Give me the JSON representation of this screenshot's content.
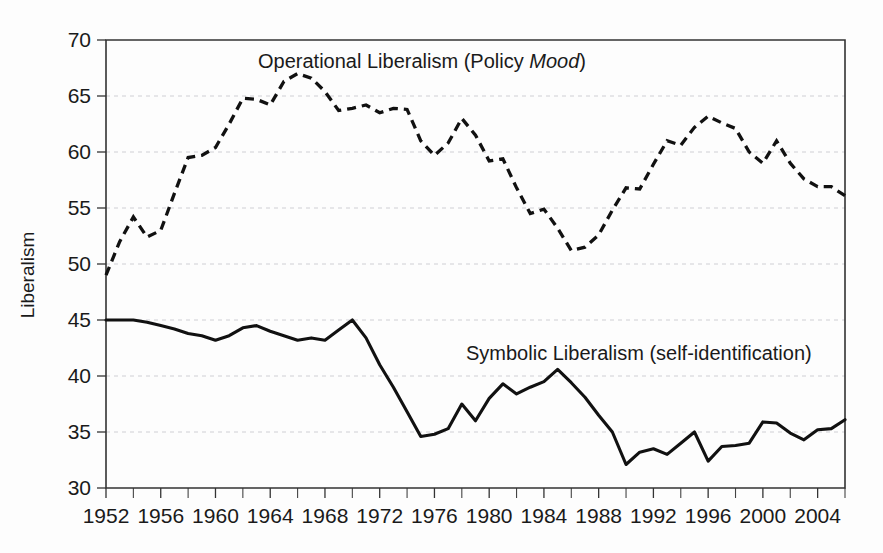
{
  "chart_data": {
    "type": "line",
    "title": "",
    "xlabel": "",
    "ylabel": "Liberalism",
    "xlim": [
      1952,
      2006
    ],
    "ylim": [
      30,
      70
    ],
    "ytick_step": 5,
    "xtick_label_step": 4,
    "xtick_minor_step": 2,
    "grid": true,
    "legend_position": "inline-annotations",
    "yticks": [
      30,
      35,
      40,
      45,
      50,
      55,
      60,
      65,
      70
    ],
    "xticks": [
      1952,
      1956,
      1960,
      1964,
      1968,
      1972,
      1976,
      1980,
      1984,
      1988,
      1992,
      1996,
      2000,
      2004
    ],
    "x": [
      1952,
      1953,
      1954,
      1955,
      1956,
      1957,
      1958,
      1959,
      1960,
      1961,
      1962,
      1963,
      1964,
      1965,
      1966,
      1967,
      1968,
      1969,
      1970,
      1971,
      1972,
      1973,
      1974,
      1975,
      1976,
      1977,
      1978,
      1979,
      1980,
      1981,
      1982,
      1983,
      1984,
      1985,
      1986,
      1987,
      1988,
      1989,
      1990,
      1991,
      1992,
      1993,
      1994,
      1995,
      1996,
      1997,
      1998,
      1999,
      2000,
      2001,
      2002,
      2003,
      2004,
      2005,
      2006
    ],
    "series": [
      {
        "name": "Operational Liberalism (Policy Mood)",
        "style": "dashed",
        "color": "#111111",
        "annotation": "Operational Liberalism (Policy Mood)",
        "annotation_italic_word": "Mood",
        "values": [
          49.0,
          52.0,
          54.2,
          52.4,
          53.0,
          56.3,
          59.5,
          59.7,
          60.4,
          62.5,
          64.8,
          64.7,
          64.2,
          66.3,
          67.0,
          66.6,
          65.4,
          63.7,
          63.9,
          64.2,
          63.5,
          63.9,
          63.8,
          61.0,
          59.7,
          60.8,
          63.0,
          61.5,
          59.2,
          59.4,
          56.8,
          54.5,
          54.9,
          53.2,
          51.2,
          51.5,
          52.6,
          54.8,
          56.8,
          56.7,
          58.9,
          61.0,
          60.6,
          62.2,
          63.2,
          62.6,
          62.1,
          60.0,
          59.0,
          61.0,
          59.0,
          57.6,
          56.9,
          56.9,
          56.1
        ]
      },
      {
        "name": "Symbolic Liberalism (self-identification)",
        "style": "solid",
        "color": "#111111",
        "annotation": "Symbolic Liberalism (self-identification)",
        "values": [
          45.0,
          45.0,
          45.0,
          44.8,
          44.5,
          44.2,
          43.8,
          43.6,
          43.2,
          43.6,
          44.3,
          44.5,
          44.0,
          43.6,
          43.2,
          43.4,
          43.2,
          44.1,
          45.0,
          43.4,
          41.0,
          39.0,
          36.8,
          34.6,
          34.8,
          35.3,
          37.5,
          36.0,
          38.0,
          39.3,
          38.4,
          39.0,
          39.5,
          40.6,
          39.4,
          38.1,
          36.5,
          35.0,
          32.1,
          33.2,
          33.5,
          33.0,
          34.0,
          35.0,
          36.5,
          37.3,
          36.0,
          36.4,
          37.5,
          38.5,
          37.0,
          34.8,
          33.5,
          32.0,
          31.5
        ]
      }
    ],
    "series2_tail": {
      "note": "extended symbolic values beyond index 54 are encoded in series values list",
      "values_1996_2006": [
        32.4,
        33.7,
        33.8,
        34.0,
        35.9,
        35.8,
        34.9,
        34.3,
        35.2,
        35.3,
        36.1
      ]
    }
  },
  "annotations": {
    "operational": {
      "prefix": "Operational Liberalism (Policy ",
      "italic": "Mood",
      "suffix": ")",
      "x_px": 258,
      "y_px": 68
    },
    "symbolic": {
      "text": "Symbolic Liberalism (self-identification)",
      "x_px": 466,
      "y_px": 360
    }
  },
  "axes": {
    "ylabel": "Liberalism",
    "ytick_labels": [
      "70",
      "65",
      "60",
      "55",
      "50",
      "45",
      "40",
      "35",
      "30"
    ],
    "xtick_labels": [
      "1952",
      "1956",
      "1960",
      "1964",
      "1968",
      "1972",
      "1976",
      "1980",
      "1984",
      "1988",
      "1992",
      "1996",
      "2000",
      "2004"
    ]
  },
  "colors": {
    "line": "#111111",
    "grid": "#c9c9cf",
    "axis": "#333333",
    "background": "#fdfdfd",
    "text": "#1a1a1a"
  }
}
